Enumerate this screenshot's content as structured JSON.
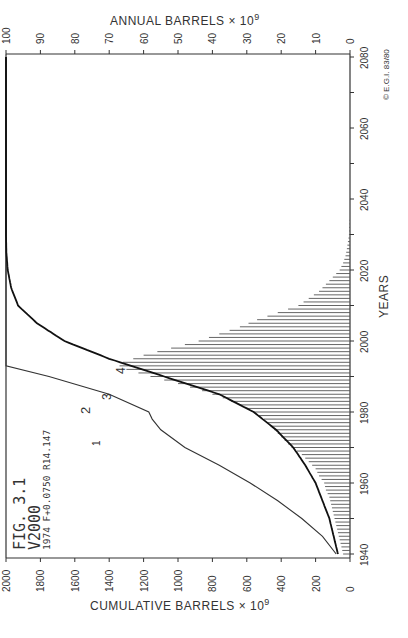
{
  "figure": {
    "fig_label": "FIG. 3.1",
    "variant_label": "V2000",
    "params_label": "1974 F+0.0750 R14.147",
    "credit": "© E.G.I. 83/80"
  },
  "axes": {
    "top_title": "ANNUAL  BARRELS × 10",
    "top_title_exp": "9",
    "bottom_title": "CUMULATIVE  BARRELS × 10",
    "bottom_title_exp": "9",
    "years_title": "YEARS",
    "annual_ticks": [
      "100",
      "90",
      "80",
      "70",
      "60",
      "50",
      "40",
      "30",
      "20",
      "10",
      "0"
    ],
    "cumulative_ticks": [
      "2000",
      "1800",
      "1600",
      "1400",
      "1200",
      "1000",
      "800",
      "600",
      "400",
      "200",
      "0"
    ],
    "year_ticks": [
      "1940",
      "1960",
      "1980",
      "2000",
      "2020",
      "2040",
      "2060",
      "2080"
    ]
  },
  "curve_labels": [
    "1",
    "2",
    "3",
    "4"
  ],
  "chart_data": {
    "type": "bar",
    "orientation": "rotated 90° counter-clockwise (years run bottom-to-top on right edge)",
    "xlabel": "YEARS",
    "ylabel_annual": "ANNUAL BARRELS × 10^9",
    "ylabel_cumulative": "CUMULATIVE BARRELS × 10^9",
    "xlim": [
      1940,
      2080
    ],
    "ylim_annual": [
      0,
      100
    ],
    "ylim_cumulative": [
      0,
      2000
    ],
    "grid": false,
    "series": [
      {
        "name": "Annual production (bars)",
        "type": "bar",
        "x": [
          1940,
          1942,
          1944,
          1946,
          1948,
          1950,
          1952,
          1954,
          1956,
          1958,
          1960,
          1962,
          1964,
          1966,
          1968,
          1970,
          1972,
          1974,
          1976,
          1978,
          1980,
          1982,
          1984,
          1986,
          1988,
          1990,
          1992,
          1993,
          1994,
          1996,
          1998,
          2000,
          2002,
          2004,
          2006,
          2008,
          2010,
          2012,
          2014,
          2016,
          2018,
          2020,
          2022,
          2024,
          2026,
          2028,
          2030,
          2032,
          2034
        ],
        "values": [
          2,
          2.5,
          3,
          3.5,
          4,
          4.5,
          5,
          5.5,
          6,
          7,
          7.5,
          9,
          10,
          12,
          14,
          17,
          19,
          21,
          23,
          25,
          28,
          32,
          37,
          43,
          50,
          58,
          65,
          67,
          66,
          60,
          52,
          44,
          38,
          32,
          27,
          21,
          15,
          12,
          9,
          7,
          5,
          3,
          2,
          1.3,
          0.9,
          0.6,
          0.3,
          0.2,
          0.1
        ]
      },
      {
        "name": "Cumulative production (curve 4)",
        "type": "line",
        "x": [
          1940,
          1950,
          1960,
          1965,
          1970,
          1975,
          1980,
          1985,
          1990,
          1995,
          2000,
          2005,
          2010,
          2015,
          2020,
          2025,
          2030,
          2080
        ],
        "values": [
          70,
          120,
          200,
          260,
          330,
          430,
          560,
          760,
          1080,
          1400,
          1660,
          1820,
          1930,
          1970,
          1990,
          1998,
          2000,
          2000
        ]
      },
      {
        "name": "Cumulative discoveries (curve 1-2-3)",
        "type": "line",
        "x": [
          1940,
          1945,
          1950,
          1955,
          1960,
          1965,
          1970,
          1975,
          1978,
          1980,
          1985,
          1990,
          1993,
          2080
        ],
        "values": [
          80,
          160,
          280,
          420,
          580,
          760,
          960,
          1100,
          1150,
          1170,
          1400,
          1750,
          2000,
          2000
        ]
      }
    ]
  }
}
